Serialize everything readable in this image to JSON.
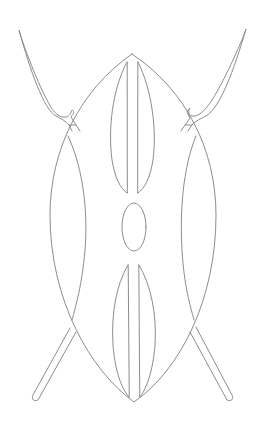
{
  "illustration": {
    "subject": "shield-with-crossed-spears",
    "colors": {
      "background": "#ffffff",
      "stroke": "#8c8c8c"
    },
    "elements": [
      {
        "name": "left-spear",
        "kind": "spear"
      },
      {
        "name": "right-spear",
        "kind": "spear"
      },
      {
        "name": "shield",
        "kind": "shield"
      },
      {
        "name": "shield-left-panel",
        "kind": "decoration"
      },
      {
        "name": "shield-right-panel",
        "kind": "decoration"
      },
      {
        "name": "shield-top-lens",
        "kind": "decoration"
      },
      {
        "name": "shield-center-oval",
        "kind": "decoration"
      },
      {
        "name": "shield-bottom-lens",
        "kind": "decoration"
      }
    ]
  }
}
